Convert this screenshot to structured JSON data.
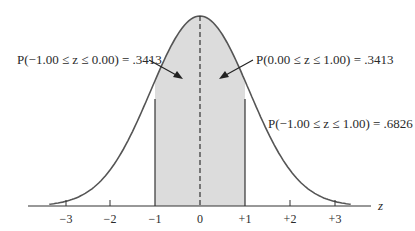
{
  "chart_data": {
    "type": "area",
    "xlabel": "z",
    "ylabel": "",
    "xlim": [
      -3.5,
      3.5
    ],
    "ticks": [
      "-3",
      "-2",
      "-1",
      "0",
      "+1",
      "+2",
      "+3"
    ],
    "tick_values": [
      -3,
      -2,
      -1,
      0,
      1,
      2,
      3
    ],
    "shaded_region": [
      -1,
      1
    ],
    "mean_line": 0,
    "annotations": [
      {
        "text": "P(−1.00 ≤ z ≤ 0.00) = .3413",
        "region": [
          -1,
          0
        ],
        "value": 0.3413
      },
      {
        "text": "P(0.00 ≤ z ≤ 1.00) = .3413",
        "region": [
          0,
          1
        ],
        "value": 0.3413
      },
      {
        "text": "P(−1.00 ≤ z ≤ 1.00) = .6826",
        "region": [
          -1,
          1
        ],
        "value": 0.6826
      }
    ],
    "grid": false,
    "colors": {
      "curve": "#555555",
      "shade": "#dcdcdc",
      "axis": "#333333"
    }
  },
  "labels": {
    "left": "P(−1.00 ≤ z ≤ 0.00) = .3413",
    "right": "P(0.00 ≤ z ≤ 1.00) = .3413",
    "total": "P(−1.00 ≤ z ≤ 1.00) = .6826",
    "axis": "z"
  },
  "ticks": [
    "−3",
    "−2",
    "−1",
    "0",
    "+1",
    "+2",
    "+3"
  ]
}
